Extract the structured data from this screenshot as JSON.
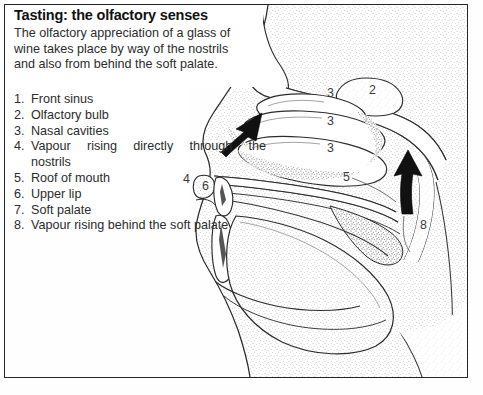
{
  "header": {
    "title": "Tasting: the olfactory senses",
    "subtitle_lines": [
      "The olfactory appreciation of a glass of",
      "wine takes place by way of the nostrils",
      "and also from behind the soft palate."
    ]
  },
  "legend": {
    "items": [
      {
        "num": "1.",
        "text": "Front sinus",
        "continuation": ""
      },
      {
        "num": "2.",
        "text": "Olfactory bulb",
        "continuation": ""
      },
      {
        "num": "3.",
        "text": "Nasal cavities",
        "continuation": ""
      },
      {
        "num": "4.",
        "text": "Vapour rising directly through the",
        "continuation": "nostrils"
      },
      {
        "num": "5.",
        "text": "Roof of mouth",
        "continuation": ""
      },
      {
        "num": "6.",
        "text": "Upper lip",
        "continuation": ""
      },
      {
        "num": "7.",
        "text": "Soft palate",
        "continuation": ""
      },
      {
        "num": "8.",
        "text": "Vapour rising behind the soft palate",
        "continuation": ""
      }
    ]
  },
  "diagram": {
    "caption_alt": "sagittal section of human head showing nasal cavities, mouth and soft palate",
    "callouts": [
      {
        "label": "2",
        "x": 369,
        "y": 83
      },
      {
        "label": "3",
        "x": 327,
        "y": 86
      },
      {
        "label": "3",
        "x": 327,
        "y": 114
      },
      {
        "label": "3",
        "x": 327,
        "y": 141
      },
      {
        "label": "4",
        "x": 183,
        "y": 172
      },
      {
        "label": "6",
        "x": 202,
        "y": 179
      },
      {
        "label": "5",
        "x": 343,
        "y": 170
      },
      {
        "label": "8",
        "x": 420,
        "y": 218
      }
    ],
    "arrows": [
      {
        "name": "vapour-arrow-nostrils",
        "x": 248,
        "y": 128
      },
      {
        "name": "vapour-arrow-soft-palate",
        "x": 408,
        "y": 168
      }
    ]
  },
  "colors": {
    "ink": "#262626",
    "paper": "#ffffff",
    "text": "#2c2c2c",
    "stipple": "#9a9a9a"
  }
}
